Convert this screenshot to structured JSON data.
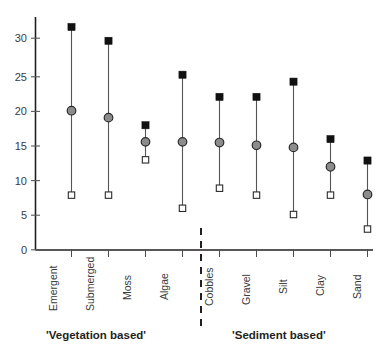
{
  "chart_data": {
    "type": "scatter",
    "title": "",
    "subtitle": "",
    "xlabel": "",
    "ylabel": "",
    "ylim": [
      0,
      33.5
    ],
    "yticks": [
      0,
      5,
      10,
      15,
      20,
      25,
      30
    ],
    "ytick_labels": [
      "0",
      "5",
      "10",
      "15",
      "20",
      "25",
      "30"
    ],
    "grid": false,
    "legend_position": "none",
    "categories": [
      "Emergent",
      "Submerged",
      "Moss",
      "Algae",
      "Cobbles",
      "Gravel",
      "Silt",
      "Clay",
      "Sand"
    ],
    "series": [
      {
        "name": "maximum",
        "marker": "filled-square",
        "color": "#111111",
        "values": [
          32.2,
          30.2,
          18.0,
          25.3,
          22.1,
          22.1,
          24.3,
          16.0,
          12.9
        ]
      },
      {
        "name": "median",
        "marker": "filled-circle",
        "color": "#8c8c8c",
        "values": [
          20.1,
          19.1,
          15.6,
          15.6,
          15.5,
          15.1,
          14.8,
          12.0,
          8.0
        ]
      },
      {
        "name": "minimum",
        "marker": "open-square",
        "color": "#ffffff",
        "values": [
          7.9,
          7.9,
          13.0,
          6.0,
          8.9,
          7.9,
          5.1,
          7.9,
          3.0
        ]
      }
    ],
    "annotations": [
      {
        "id": "group-divider",
        "type": "dashed-vertical-line",
        "between_categories": [
          "Algae",
          "Cobbles"
        ]
      }
    ],
    "group_labels": [
      {
        "id": "vegetation",
        "text": "'Vegetation based'",
        "categories": [
          "Emergent",
          "Submerged",
          "Moss",
          "Algae"
        ]
      },
      {
        "id": "sediment",
        "text": "'Sediment based'",
        "categories": [
          "Cobbles",
          "Gravel",
          "Silt",
          "Clay",
          "Sand"
        ]
      }
    ]
  },
  "axis": {
    "y_tick_0": "0",
    "y_tick_5": "5",
    "y_tick_10": "10",
    "y_tick_15": "15",
    "y_tick_20": "20",
    "y_tick_25": "25",
    "y_tick_30": "30"
  },
  "categories": {
    "c0": "Emergent",
    "c1": "Submerged",
    "c2": "Moss",
    "c3": "Algae",
    "c4": "Cobbles",
    "c5": "Gravel",
    "c6": "Silt",
    "c7": "Clay",
    "c8": "Sand"
  },
  "groups": {
    "vegetation_label": "'Vegetation based'",
    "sediment_label": "'Sediment based'"
  },
  "colors": {
    "max_marker": "#111111",
    "mid_marker": "#8c8c8c",
    "min_marker": "#ffffff",
    "line": "#555555",
    "axis": "#231f20",
    "text": "#3b3b3b",
    "background": "#ffffff"
  }
}
